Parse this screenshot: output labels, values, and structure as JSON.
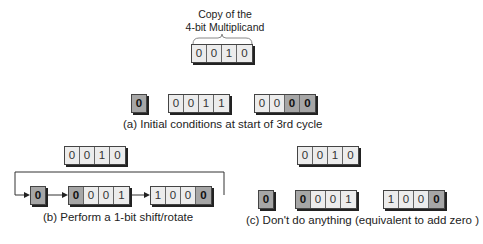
{
  "top": {
    "label_line1": "Copy of the",
    "label_line2": "4-bit Multiplicand",
    "register": [
      "0",
      "0",
      "1",
      "0"
    ]
  },
  "panel_a": {
    "carry": "0",
    "accumulator": [
      "0",
      "0",
      "1",
      "1"
    ],
    "product": [
      "0",
      "0",
      "0",
      "0"
    ],
    "product_highlight": [
      false,
      false,
      true,
      true
    ],
    "caption": "(a) Initial conditions at start of 3rd cycle"
  },
  "panel_b": {
    "multiplicand": [
      "0",
      "0",
      "1",
      "0"
    ],
    "carry": "0",
    "accumulator": [
      "0",
      "0",
      "0",
      "1"
    ],
    "accumulator_highlight": [
      true,
      false,
      false,
      false
    ],
    "product": [
      "1",
      "0",
      "0",
      "0"
    ],
    "product_highlight": [
      false,
      false,
      false,
      true
    ],
    "caption": "(b) Perform a 1-bit shift/rotate"
  },
  "panel_c": {
    "multiplicand": [
      "0",
      "0",
      "1",
      "0"
    ],
    "carry": "0",
    "accumulator": [
      "0",
      "0",
      "0",
      "1"
    ],
    "accumulator_highlight": [
      true,
      false,
      false,
      false
    ],
    "product": [
      "1",
      "0",
      "0",
      "0"
    ],
    "product_highlight": [
      false,
      false,
      false,
      true
    ],
    "caption": "(c) Don't do anything (equivalent to add zero )"
  }
}
